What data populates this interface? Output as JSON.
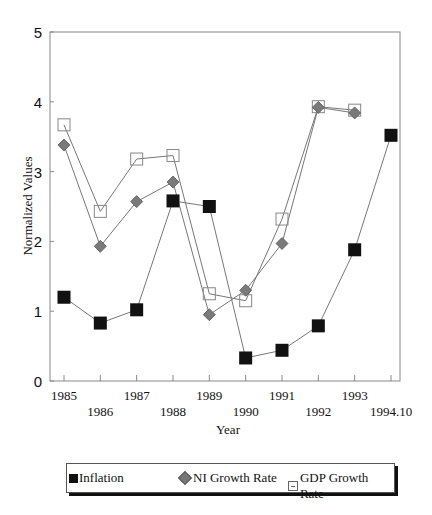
{
  "chart_data": {
    "type": "line",
    "title": "",
    "xlabel": "Year",
    "ylabel": "Normalized Values",
    "ylim": [
      0,
      5
    ],
    "yticks": [
      0,
      1,
      2,
      3,
      4,
      5
    ],
    "grid": false,
    "legend_position": "bottom",
    "categories": [
      "1985",
      "1986",
      "1987",
      "1988",
      "1989",
      "1990",
      "1991",
      "1992",
      "1993",
      "1994.10"
    ],
    "series": [
      {
        "name": "Inflation",
        "marker": "filled-square",
        "color": "#111111",
        "values": [
          1.2,
          0.83,
          1.02,
          2.58,
          2.5,
          0.33,
          0.44,
          0.79,
          1.88,
          3.52
        ]
      },
      {
        "name": "NI Growth Rate",
        "marker": "diamond",
        "color": "#777777",
        "values": [
          3.38,
          1.93,
          2.57,
          2.85,
          0.95,
          1.3,
          1.97,
          3.92,
          3.84,
          null
        ]
      },
      {
        "name": "GDP Growth Rate",
        "marker": "open-square",
        "color": "#ffffff",
        "values": [
          3.67,
          2.43,
          3.18,
          3.23,
          1.25,
          1.15,
          2.32,
          3.93,
          3.88,
          null
        ]
      }
    ]
  },
  "legend": {
    "inflation": "Inflation",
    "ni": "NI Growth Rate",
    "gdp": "GDP Growth Rate"
  }
}
